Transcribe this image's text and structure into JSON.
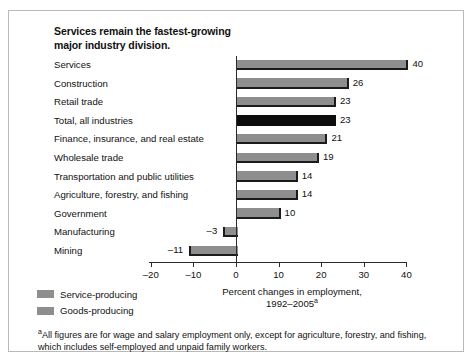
{
  "chart_data": {
    "type": "bar",
    "orientation": "horizontal",
    "title": "Services remain the fastest-growing major industry division.",
    "title_lines": [
      "Services remain the fastest-growing",
      "major industry division."
    ],
    "xlabel_lines": [
      "Percent changes in employment,",
      "1992–2005"
    ],
    "xlabel_superscript": "a",
    "ylabel": "",
    "xlim": [
      -20,
      40
    ],
    "xticks": [
      -20,
      -10,
      0,
      10,
      20,
      30,
      40
    ],
    "xtick_labels": [
      "–20",
      "–10",
      "0",
      "10",
      "20",
      "30",
      "40"
    ],
    "grid": false,
    "categories": [
      "Services",
      "Construction",
      "Retail trade",
      "Total, all industries",
      "Finance, insurance, and real estate",
      "Wholesale trade",
      "Transportation and public utilities",
      "Agriculture, forestry, and fishing",
      "Government",
      "Manufacturing",
      "Mining"
    ],
    "values": [
      40,
      26,
      23,
      23,
      21,
      19,
      14,
      14,
      10,
      -3,
      -11
    ],
    "value_labels": [
      "40",
      "26",
      "23",
      "23",
      "21",
      "19",
      "14",
      "14",
      "10",
      "–3",
      "–11"
    ],
    "series_of_bar": [
      "service",
      "goods",
      "service",
      "total",
      "service",
      "service",
      "service",
      "goods",
      "service",
      "goods",
      "goods"
    ],
    "legend": {
      "position": "bottom-left",
      "entries": [
        {
          "label": "Service-producing",
          "key": "service"
        },
        {
          "label": "Goods-producing",
          "key": "goods"
        }
      ]
    },
    "footnote": "All figures are for wage and salary employment only, except for agriculture, forestry, and fishing, which includes self-employed and unpaid family workers.",
    "footnote_marker": "a",
    "colors": {
      "bar_service": "#8e8e8e",
      "bar_goods": "#8e8e8e",
      "bar_total": "#0d0d0d",
      "bar_shadow": "#1b1b1b",
      "axis": "#2b2b2b",
      "frame": "#b9b9b9",
      "background": "#ffffff",
      "text": "#111111"
    }
  }
}
